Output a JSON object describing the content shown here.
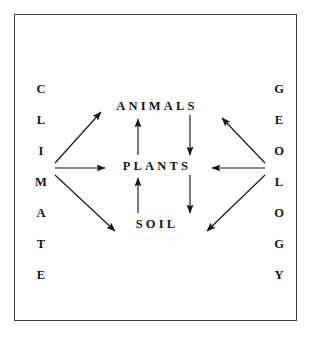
{
  "diagram": {
    "background_color": "#fefefe",
    "frame_color": "#3a3a42",
    "ink_color": "#15151a",
    "left_column": {
      "word": "CLIMATE",
      "letters": [
        "C",
        "L",
        "I",
        "M",
        "A",
        "T",
        "E"
      ],
      "hub_letter": "M",
      "hub_index": 3
    },
    "right_column": {
      "word": "GEOLOGY",
      "letters": [
        "G",
        "E",
        "O",
        "L",
        "O",
        "G",
        "Y"
      ],
      "hub_letter": "L",
      "hub_index": 3
    },
    "nodes": [
      {
        "id": "animals",
        "label": "ANIMALS"
      },
      {
        "id": "plants",
        "label": "PLANTS"
      },
      {
        "id": "soil",
        "label": "SOIL"
      }
    ],
    "edges": [
      {
        "from": "CLIMATE",
        "to": "ANIMALS",
        "direction": "up-right",
        "kind": "diagonal"
      },
      {
        "from": "CLIMATE",
        "to": "PLANTS",
        "direction": "right",
        "kind": "horizontal"
      },
      {
        "from": "CLIMATE",
        "to": "SOIL",
        "direction": "down-right",
        "kind": "diagonal"
      },
      {
        "from": "GEOLOGY",
        "to": "ANIMALS",
        "direction": "up-left",
        "kind": "diagonal"
      },
      {
        "from": "GEOLOGY",
        "to": "PLANTS",
        "direction": "left",
        "kind": "horizontal"
      },
      {
        "from": "GEOLOGY",
        "to": "SOIL",
        "direction": "down-left",
        "kind": "diagonal"
      },
      {
        "from": "PLANTS",
        "to": "ANIMALS",
        "direction": "up",
        "kind": "vertical"
      },
      {
        "from": "ANIMALS",
        "to": "PLANTS",
        "direction": "down",
        "kind": "vertical"
      },
      {
        "from": "SOIL",
        "to": "PLANTS",
        "direction": "up",
        "kind": "vertical"
      },
      {
        "from": "PLANTS",
        "to": "SOIL",
        "direction": "down",
        "kind": "vertical"
      }
    ]
  }
}
